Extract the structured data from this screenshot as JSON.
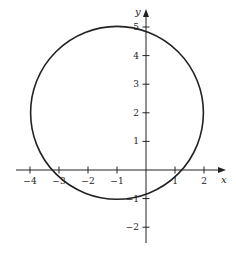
{
  "diagram": {
    "type": "circle-on-cartesian-plane",
    "axes": {
      "x_label": "x",
      "y_label": "y",
      "x_ticks": [
        -4,
        -3,
        -2,
        -1,
        1,
        2
      ],
      "x_tick_labels": [
        "−4",
        "−3",
        "−2",
        "−1",
        "1",
        "2"
      ],
      "y_ticks": [
        -2,
        -1,
        1,
        2,
        3,
        4,
        5
      ],
      "y_tick_labels": [
        "−2",
        "−1",
        "1",
        "2",
        "3",
        "4",
        "5"
      ],
      "x_range": [
        -4.5,
        2.7
      ],
      "y_range": [
        -2.5,
        5.6
      ]
    },
    "circle": {
      "center": [
        -1,
        2
      ],
      "radius": 3
    },
    "colors": {
      "stroke": "#222222",
      "background": "#ffffff"
    }
  }
}
